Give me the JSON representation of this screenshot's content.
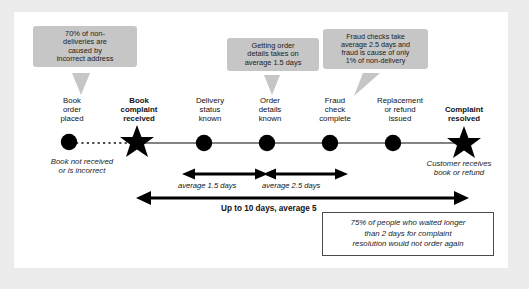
{
  "diagram": {
    "colors": {
      "callout_bg": "#c6c6c6",
      "marker": "#000000",
      "line": "#555555",
      "page_bg": "#ececec",
      "canvas_bg": "#ffffff"
    },
    "callouts": [
      {
        "id": "callout-non-delivery-address",
        "text": "70% of non-\ndeliveries are\ncaused by\nincorrect address"
      },
      {
        "id": "callout-order-details-time",
        "text": "Getting order\ndetails takes on\naverage 1.5 days"
      },
      {
        "id": "callout-fraud-check",
        "text": "Fraud checks take\naverage 2.5 days and\nfraud is cause of only\n1% of non-delivery"
      }
    ],
    "milestones": [
      {
        "id": "book-order-placed",
        "label": "Book\norder\nplaced",
        "marker": "circle",
        "bold": false
      },
      {
        "id": "book-complaint-received",
        "label": "Book\ncomplaint\nreceived",
        "marker": "star",
        "bold": true
      },
      {
        "id": "delivery-status-known",
        "label": "Delivery\nstatus\nknown",
        "marker": "circle",
        "bold": false
      },
      {
        "id": "order-details-known",
        "label": "Order\ndetails\nknown",
        "marker": "circle",
        "bold": false
      },
      {
        "id": "fraud-check-complete",
        "label": "Fraud\ncheck\ncomplete",
        "marker": "circle",
        "bold": false
      },
      {
        "id": "replacement-refund",
        "label": "Replacement\nor refund\nissued",
        "marker": "circle",
        "bold": false
      },
      {
        "id": "complaint-resolved",
        "label": "Complaint\nresolved",
        "marker": "star",
        "bold": true
      }
    ],
    "notes": [
      {
        "id": "note-book-not-received",
        "text": "Book not received\nor is incorrect"
      },
      {
        "id": "note-customer-receives",
        "text": "Customer receives\nbook or refund"
      }
    ],
    "spans": [
      {
        "id": "span-delivery-to-order",
        "label": "average 1.5 days",
        "bold": false
      },
      {
        "id": "span-order-to-fraud",
        "label": "average 2.5 days",
        "bold": false
      },
      {
        "id": "span-total",
        "label": "Up to 10 days, average 5",
        "bold": true
      }
    ],
    "stat_box": {
      "id": "stat-box-repeat-orders",
      "text": "75% of people who waited longer\nthan 2 days for complaint\nresolution would not order again"
    }
  }
}
